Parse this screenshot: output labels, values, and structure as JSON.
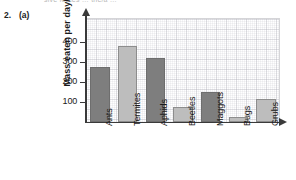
{
  "page": {
    "question_number": "2.",
    "question_part": "(a)",
    "cropped_header_text": "sive forces … the/a …"
  },
  "chart_data": {
    "type": "bar",
    "title": "",
    "xlabel": "",
    "ylabel": "Mass eaten per day/g",
    "categories": [
      "Ants",
      "Termites",
      "Aphids",
      "Beetles",
      "Maggots",
      "Bugs",
      "Grubs"
    ],
    "values": [
      275,
      380,
      320,
      75,
      150,
      25,
      115
    ],
    "ylim": [
      0,
      480
    ],
    "yticks": [
      100,
      200,
      300,
      400
    ],
    "ytick_labels": [
      "100",
      "200",
      "300",
      "400"
    ],
    "grid": true,
    "legend": "none",
    "bar_colors": [
      "#7e7e7e",
      "#bdbdbd",
      "#7e7e7e",
      "#bdbdbd",
      "#7e7e7e",
      "#bdbdbd",
      "#bdbdbd"
    ],
    "colors": {
      "bar_dark": "#7e7e7e",
      "bar_light": "#bdbdbd",
      "bar_edge": "#6e6e6e",
      "axis": "#3a3a3a",
      "grid": "#aaaab4",
      "text": "#1a1a1a",
      "background": "#ffffff"
    }
  }
}
